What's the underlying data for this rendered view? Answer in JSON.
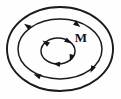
{
  "figure": {
    "background_color": "#fefefe",
    "stroke_color": "#1a1a1a",
    "arrow_color": "#141414",
    "label": {
      "text": "M",
      "x": 81,
      "y": 42,
      "font_size": 13,
      "color": "#101010"
    },
    "loops": [
      {
        "name": "outer-loop",
        "cx": 60,
        "cy": 49,
        "rx": 53,
        "ry": 42,
        "stroke_width": 1.9,
        "arrows": []
      },
      {
        "name": "middle-loop",
        "cx": 60,
        "cy": 49,
        "rx": 42,
        "ry": 30,
        "stroke_width": 1.5,
        "arrows": [
          {
            "name": "arrow-middle-top-right",
            "cx": 77.5,
            "cy": 24.8,
            "angle": 36
          },
          {
            "name": "arrow-middle-top-left",
            "cx": 27.0,
            "cy": 25.8,
            "angle": 214
          },
          {
            "name": "arrow-middle-bottom-right",
            "cx": 92.0,
            "cy": 69.5,
            "angle": 115
          },
          {
            "name": "arrow-middle-bottom-left",
            "cx": 37.0,
            "cy": 75.5,
            "angle": 200
          }
        ]
      },
      {
        "name": "inner-loop",
        "cx": 58,
        "cy": 51,
        "rx": 17,
        "ry": 13,
        "stroke_width": 1.5,
        "arrows": [
          {
            "name": "arrow-inner-top-right",
            "cx": 68.5,
            "cy": 41.5,
            "angle": 32
          },
          {
            "name": "arrow-inner-top-left",
            "cx": 45.5,
            "cy": 42.5,
            "angle": 215
          },
          {
            "name": "arrow-inner-bottom-right",
            "cx": 71.0,
            "cy": 58.0,
            "angle": 108
          },
          {
            "name": "arrow-inner-bottom-left",
            "cx": 56.5,
            "cy": 64.0,
            "angle": 186
          }
        ]
      }
    ],
    "arrow_geometry": {
      "length": 7.2,
      "half_width": 2.6
    }
  }
}
